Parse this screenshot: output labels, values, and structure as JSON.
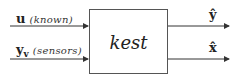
{
  "diagram": {
    "block": {
      "label": "kest"
    },
    "inputs": [
      {
        "symbol": "u",
        "subscript": "",
        "description": "(known)"
      },
      {
        "symbol": "y",
        "subscript": "v",
        "description": "(sensors)"
      }
    ],
    "outputs": [
      {
        "symbol": "ŷ"
      },
      {
        "symbol": "x̂"
      }
    ],
    "colors": {
      "line": "#333333",
      "box_border": "#555555",
      "text": "#222222"
    }
  }
}
